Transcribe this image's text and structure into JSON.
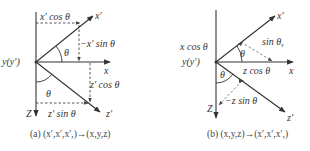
{
  "panel_a": {
    "caption": "(a) (x′,x′,x′,)→(x,y,z)",
    "labels": {
      "x_prime": "x′",
      "x": "x",
      "z_prime": "z′",
      "z": "Z",
      "origin": "y(y′)",
      "theta_top": "θ",
      "theta_bottom": "θ",
      "x_prime_cos": "x′ cos θ",
      "neg_x_prime_sin": "−x′ sin θ",
      "z_prime_cos": "z′ cos θ",
      "z_prime_sin": "z′ sin θ"
    }
  },
  "panel_b": {
    "caption": "(b) (x,y,z)→(x′,x′,x′,)",
    "labels": {
      "x_prime": "x′",
      "x": "x",
      "z_prime": "z′",
      "z": "Z",
      "origin": "y(y′)",
      "theta_top": "θ",
      "theta_bottom": "θ",
      "x_cos": "x cos θ",
      "sin_theta_v": "sin θ",
      "sin_sub": "v",
      "z_cos": "z cos θ",
      "neg_z_sin": "−z sin θ"
    }
  },
  "colors": {
    "line": "#333333",
    "text": "#333333",
    "background": "#ffffff"
  }
}
